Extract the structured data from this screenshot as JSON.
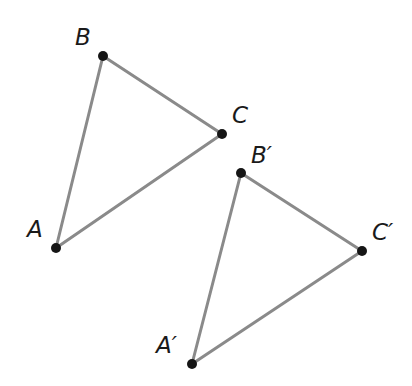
{
  "diagram": {
    "type": "geometric-translation",
    "colors": {
      "background": "#ffffff",
      "edge": "#8a8a8a",
      "vertex": "#151515",
      "label": "#1a1a1a"
    },
    "triangles": [
      {
        "name": "ABC",
        "vertices": [
          {
            "id": "A",
            "label": "A",
            "x": 56,
            "y": 248,
            "label_x": 27,
            "label_y": 237
          },
          {
            "id": "B",
            "label": "B",
            "x": 103,
            "y": 56,
            "label_x": 75,
            "label_y": 45
          },
          {
            "id": "C",
            "label": "C",
            "x": 222,
            "y": 134,
            "label_x": 232,
            "label_y": 123
          }
        ]
      },
      {
        "name": "A'B'C'",
        "vertices": [
          {
            "id": "A'",
            "label": "A′",
            "x": 192,
            "y": 364,
            "label_x": 156,
            "label_y": 353
          },
          {
            "id": "B'",
            "label": "B′",
            "x": 241,
            "y": 173,
            "label_x": 251,
            "label_y": 163
          },
          {
            "id": "C'",
            "label": "C′",
            "x": 362,
            "y": 251,
            "label_x": 372,
            "label_y": 240
          }
        ]
      }
    ]
  }
}
